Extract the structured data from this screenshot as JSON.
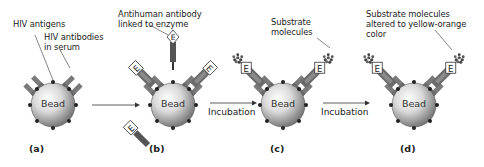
{
  "panels": [
    {
      "id": "a",
      "label": "(a)",
      "bead": "Bead"
    },
    {
      "id": "b",
      "label": "(b)",
      "bead": "Bead"
    },
    {
      "id": "c",
      "label": "(c)",
      "bead": "Bead"
    },
    {
      "id": "d",
      "label": "(d)",
      "bead": "Bead"
    }
  ],
  "annotations": {
    "hiv_antigens": "HIV antigens",
    "hiv_antibodies_1": "HIV antibodies",
    "hiv_antibodies_2": "in serum",
    "antihuman_1": "Antihuman antibody",
    "antihuman_2": "linked to enzyme",
    "substrate_1": "Substrate",
    "substrate_2": "molecules",
    "altered_1": "Substrate molecules",
    "altered_2": "altered to yellow-orange",
    "altered_3": "color"
  },
  "arrows": [
    {
      "from": "a",
      "to": "b",
      "label": ""
    },
    {
      "from": "b",
      "to": "c",
      "label": "Incubation"
    },
    {
      "from": "c",
      "to": "d",
      "label": "Incubation"
    }
  ],
  "enzyme_letter": "E",
  "colors": {
    "bead_light": "#f2f2f2",
    "bead_dark": "#7a7a7a",
    "antibody": "#6e6e6e",
    "antibody_dark": "#4a4a4a",
    "enzyme_box": "#ffffff",
    "text": "#222222"
  }
}
